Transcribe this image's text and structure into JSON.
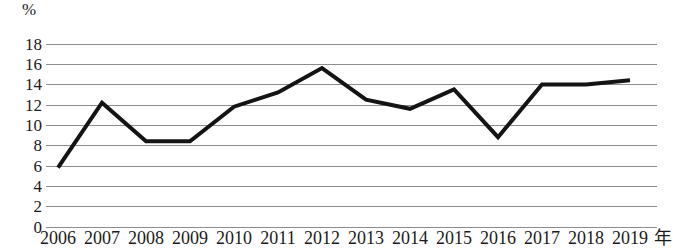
{
  "chart_data": {
    "type": "line",
    "title": "",
    "subtitle": "",
    "xlabel": "年",
    "ylabel": "%",
    "x": [
      "2006",
      "2007",
      "2008",
      "2009",
      "2010",
      "2011",
      "2012",
      "2013",
      "2014",
      "2015",
      "2016",
      "2017",
      "2018",
      "2019"
    ],
    "categories": [
      "2006",
      "2007",
      "2008",
      "2009",
      "2010",
      "2011",
      "2012",
      "2013",
      "2014",
      "2015",
      "2016",
      "2017",
      "2018",
      "2019"
    ],
    "values": [
      5.8,
      12.2,
      8.4,
      8.4,
      11.8,
      13.2,
      15.6,
      12.5,
      11.6,
      13.5,
      8.8,
      14.0,
      14.0,
      14.4
    ],
    "series": [
      {
        "name": "",
        "values": [
          5.8,
          12.2,
          8.4,
          8.4,
          11.8,
          13.2,
          15.6,
          12.5,
          11.6,
          13.5,
          8.8,
          14.0,
          14.0,
          14.4
        ]
      }
    ],
    "ylim": [
      0,
      18
    ],
    "yticks": [
      0,
      2,
      4,
      6,
      8,
      10,
      12,
      14,
      16,
      18
    ],
    "ytick_labels": [
      "0",
      "2",
      "4",
      "6",
      "8",
      "10",
      "12",
      "14",
      "16",
      "18"
    ],
    "grid": "horizontal",
    "legend": "none",
    "line_color": "#141414",
    "line_width": 4,
    "grid_color": "#8d8d8d",
    "background_color": "#ffffff",
    "annotations": []
  }
}
